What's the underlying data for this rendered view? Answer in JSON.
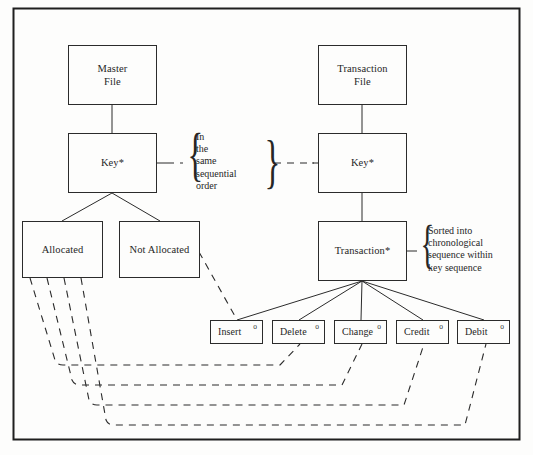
{
  "diagram": {
    "frame_color": "#1f1f1f",
    "line_color": "#2b2b2b",
    "background": "#fdfdfc",
    "nodes": {
      "master_file": "Master\nFile",
      "master_key": "Key*",
      "allocated": "Allocated",
      "not_allocated": "Not Allocated",
      "transaction_file": "Transaction\nFile",
      "transaction_key": "Key*",
      "transaction": "Transaction*"
    },
    "leaf_nodes": [
      {
        "label": "Insert",
        "marker": "o"
      },
      {
        "label": "Delete",
        "marker": "o"
      },
      {
        "label": "Change",
        "marker": "o"
      },
      {
        "label": "Credit",
        "marker": "o"
      },
      {
        "label": "Debit",
        "marker": "o"
      }
    ],
    "annotations": {
      "middle_brace": "In\nthe\nsame\nsequential\norder",
      "right_brace": "Sorted into\nchronological\nsequence within\nkey sequence"
    },
    "brace_glyph": "}",
    "caption": ""
  }
}
